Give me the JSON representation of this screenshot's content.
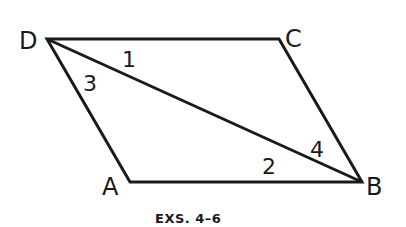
{
  "figure": {
    "caption": "EXS. 4–6",
    "line_color": "#1a1a1a",
    "vertices": {
      "D": {
        "label": "D",
        "x": 47,
        "y": 39
      },
      "C": {
        "label": "C",
        "x": 279,
        "y": 39
      },
      "B": {
        "label": "B",
        "x": 362,
        "y": 182
      },
      "A": {
        "label": "A",
        "x": 130,
        "y": 182
      }
    },
    "diagonal": [
      "D",
      "B"
    ],
    "angle_labels": [
      {
        "label": "1",
        "near": "D",
        "between": "DC and DB"
      },
      {
        "label": "3",
        "near": "D",
        "between": "DA and DB"
      },
      {
        "label": "2",
        "near": "B",
        "between": "BA and BD"
      },
      {
        "label": "4",
        "near": "B",
        "between": "BC and BD"
      }
    ]
  }
}
